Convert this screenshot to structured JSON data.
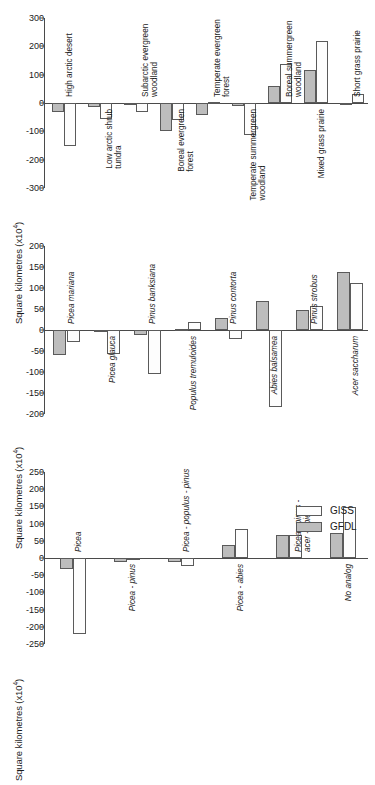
{
  "figure": {
    "background": "#ffffff",
    "bar_colors": {
      "gfdl": "#bdbdbd",
      "giss": "#fdfdfd",
      "outline": "#5a5a5a"
    }
  },
  "legend": {
    "position": "right",
    "entries": [
      {
        "label": "GISS",
        "key": "giss"
      },
      {
        "label": "GFDL",
        "key": "gfdl"
      }
    ]
  },
  "chart_data": [
    {
      "type": "bar",
      "title": "",
      "xlabel": "",
      "ylabel": "Square kilometres (x10",
      "ylabel_exponent": "4",
      "ylabel_suffix": ")",
      "ylim": [
        -300,
        300
      ],
      "yticks": [
        300,
        200,
        100,
        0,
        -100,
        -200,
        -300
      ],
      "ytick_labels": [
        "300",
        "200",
        "100",
        "0",
        "-100",
        "-200",
        "-300"
      ],
      "grid": false,
      "categories": [
        "High arctic desert",
        "Low arctic shrub tundra",
        "Subarctic evergreen woodland",
        "Boreal evergreen forest",
        "Temperate evergreen forest",
        "Temperate summergreen woodland",
        "Boreal summergreen woodland",
        "Mixed grass prairie",
        "Short grass prairie"
      ],
      "category_lines": [
        [
          "High arctic desert"
        ],
        [
          "Low arctic shrub",
          "tundra"
        ],
        [
          "Subarctic evergreen",
          "woodland"
        ],
        [
          "Boreal evergreen",
          "forest"
        ],
        [
          "Temperate evergreen",
          "forest"
        ],
        [
          "Temperate summergreen",
          "woodland"
        ],
        [
          "Boreal summergreen",
          "woodland"
        ],
        [
          "Mixed grass prairie"
        ],
        [
          "Short grass prairie"
        ]
      ],
      "label_above": [
        true,
        false,
        true,
        false,
        true,
        false,
        true,
        false,
        true
      ],
      "series": [
        {
          "name": "GFDL",
          "key": "gfdl",
          "values": [
            -30,
            -14,
            -7,
            -100,
            -42,
            -12,
            60,
            115,
            -5
          ]
        },
        {
          "name": "GISS",
          "key": "giss",
          "values": [
            -152,
            -58,
            -32,
            -60,
            4,
            -113,
            139,
            220,
            31
          ]
        }
      ]
    },
    {
      "type": "bar",
      "title": "",
      "xlabel": "",
      "ylabel": "Square kilometres (x10",
      "ylabel_exponent": "4",
      "ylabel_suffix": ")",
      "ylim": [
        -200,
        200
      ],
      "yticks": [
        200,
        150,
        100,
        50,
        0,
        -50,
        -100,
        -150,
        -200
      ],
      "ytick_labels": [
        "200",
        "150",
        "100",
        "50",
        "0",
        "-50",
        "-100",
        "-150",
        "-200"
      ],
      "grid": false,
      "categories": [
        "Picea mariana",
        "Picea glauca",
        "Pinus banksiana",
        "Populus tremuloides",
        "Pinus contorta",
        "Abies balsamea",
        "Pinus strobus",
        "Acer saccharum"
      ],
      "category_lines": [
        [
          "Picea mariana"
        ],
        [
          "Picea glauca"
        ],
        [
          "Pinus banksiana"
        ],
        [
          "Populus tremuloides"
        ],
        [
          "Pinus contorta"
        ],
        [
          "Abies balsamea"
        ],
        [
          "Pinus strobus"
        ],
        [
          "Acer saccharum"
        ]
      ],
      "label_above": [
        true,
        false,
        true,
        false,
        true,
        false,
        true,
        false
      ],
      "series": [
        {
          "name": "GFDL",
          "key": "gfdl",
          "values": [
            -60,
            -5,
            -11,
            2,
            29,
            68,
            47,
            137
          ]
        },
        {
          "name": "GISS",
          "key": "giss",
          "values": [
            -29,
            -58,
            -104,
            20,
            -21,
            -183,
            57,
            112
          ]
        }
      ]
    },
    {
      "type": "bar",
      "title": "",
      "xlabel": "",
      "ylabel": "Square kilometres (x10",
      "ylabel_exponent": "4",
      "ylabel_suffix": ")",
      "ylim": [
        -250,
        250
      ],
      "yticks": [
        250,
        200,
        150,
        100,
        50,
        0,
        -50,
        -100,
        -150,
        -200,
        -250
      ],
      "ytick_labels": [
        "250",
        "200",
        "150",
        "100",
        "50",
        "0",
        "-50",
        "-100",
        "-150",
        "-200",
        "-250"
      ],
      "grid": false,
      "categories": [
        "Picea",
        "Picea - pinus",
        "Picea - populus - pinus",
        "Picea - abies",
        "Picea - pinus - acer - abies",
        "No analog"
      ],
      "category_lines": [
        [
          "Picea"
        ],
        [
          "Picea - pinus"
        ],
        [
          "Picea - populus - pinus"
        ],
        [
          "Picea - abies"
        ],
        [
          "Picea - pinus -",
          "acer - abies"
        ],
        [
          "No analog"
        ]
      ],
      "label_above": [
        true,
        false,
        true,
        false,
        true,
        false
      ],
      "series": [
        {
          "name": "GFDL",
          "key": "gfdl",
          "values": [
            -31,
            -13,
            -12,
            39,
            68,
            72
          ]
        },
        {
          "name": "GISS",
          "key": "giss",
          "values": [
            -222,
            -3,
            -23,
            85,
            68,
            148
          ]
        }
      ]
    }
  ]
}
